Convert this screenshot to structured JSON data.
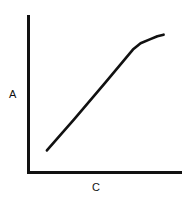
{
  "chart_data": {
    "type": "line",
    "title": "",
    "xlabel": "C",
    "ylabel": "A",
    "grid": false,
    "legend": null,
    "x_ticks": [],
    "y_ticks": [],
    "xlim": [
      0,
      100
    ],
    "ylim": [
      0,
      100
    ],
    "series": [
      {
        "name": "A vs C",
        "color": "#111111",
        "x": [
          12,
          30,
          50,
          62,
          68,
          73,
          79,
          84,
          88
        ],
        "y": [
          14,
          34,
          57,
          71,
          78,
          82,
          84.5,
          86.5,
          87.5
        ]
      }
    ]
  },
  "colors": {
    "axis": "#111111",
    "line": "#111111",
    "background": "#ffffff"
  }
}
